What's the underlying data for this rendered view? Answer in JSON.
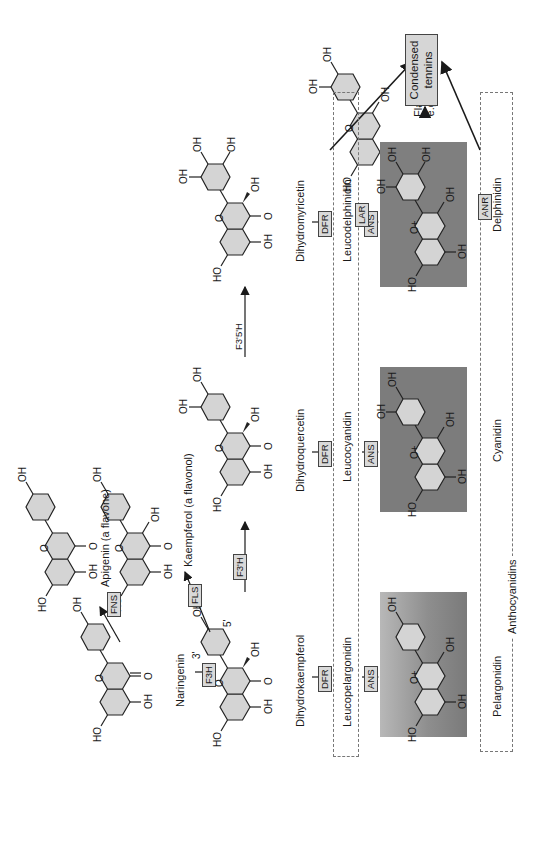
{
  "diagram": {
    "orientation": "rotated 90 degrees counter-clockwise",
    "compounds": {
      "naringenin": "Naringenin",
      "apigenin": "Apigenin (a flavone)",
      "kaempferol": "Kaempferol (a flavonol)",
      "dihydrokaempferol": "Dihydrokaempferol",
      "dihydroquercetin": "Dihydroquercetin",
      "dihydromyricetin": "Dihydromyricetin",
      "leucopelargonidin": "Leucopelargonidin",
      "leucocyanidin": "Leucocyanidin",
      "leucodelphinidin": "Leucodelphinidin",
      "pelargonidin": "Pelargonidin",
      "cyanidin": "Cyanidin",
      "delphinidin": "Delphinidin",
      "anthocyanidins": "Anthocyanidins",
      "flavan3ols_line1": "Flavan-3-ols,",
      "flavan3ols_line2": "e.g. catechin",
      "tannins_line1": "Condensed",
      "tannins_line2": "tennins"
    },
    "enzymes": {
      "fns": "FNS",
      "fls": "FLS",
      "f3h": "F3H",
      "f3prime_h": "F3'H",
      "f3prime5prime_h": "F3'5'H",
      "dfr": "DFR",
      "ans": "ANS",
      "lar": "LAR",
      "anr": "ANR"
    },
    "atoms": {
      "oh": "OH",
      "ho": "HO",
      "o": "O",
      "oplus": "O+",
      "pos3": "3'",
      "pos5": "5'"
    },
    "colors": {
      "ring_fill": "#d4d4d4",
      "anthocyanidin_box": "#7c7c7c",
      "enzyme_box": "#d9d9d9",
      "line": "#1a1a1a",
      "dash": "#777777"
    }
  }
}
